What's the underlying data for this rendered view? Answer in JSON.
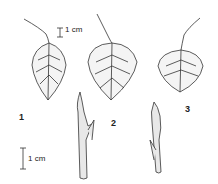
{
  "figure": {
    "labels": [
      "1",
      "2",
      "3"
    ],
    "scale_top": "1 cm",
    "scale_bottom": "1 cm"
  }
}
